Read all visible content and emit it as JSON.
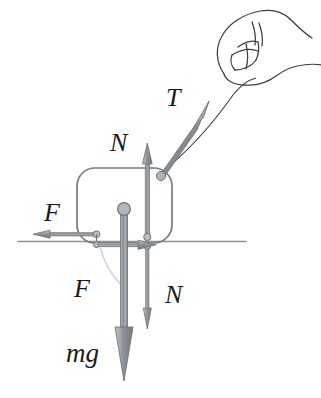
{
  "figure": {
    "type": "physics-free-body-diagram",
    "background_color": "#ffffff",
    "ink_color": "#5f6368",
    "label_color": "#1a1a1a",
    "arrow_fill": "#9aa0a6",
    "arrow_stroke": "#6b7075",
    "ground_color": "#8c9196"
  },
  "labels": {
    "tension": "T",
    "normal_up": "N",
    "normal_down": "N",
    "friction_on_block": "F",
    "friction_on_ground": "F",
    "weight": "mg"
  },
  "vectors": [
    {
      "name": "tension",
      "label": "T",
      "direction": "up-right",
      "applied_at": "block top-right corner",
      "label_x": 166,
      "label_y": 106,
      "font_size": 26
    },
    {
      "name": "normal-on-block",
      "label": "N",
      "direction": "up",
      "applied_at": "block bottom-right contact",
      "label_x": 113,
      "label_y": 151,
      "font_size": 26
    },
    {
      "name": "friction-on-block",
      "label": "F",
      "direction": "left",
      "applied_at": "block bottom-left contact",
      "label_x": 44,
      "label_y": 219,
      "font_size": 26
    },
    {
      "name": "friction-on-ground",
      "label": "F",
      "direction": "right",
      "applied_at": "ground contact",
      "label_x": 76,
      "label_y": 297,
      "font_size": 26
    },
    {
      "name": "normal-on-ground",
      "label": "N",
      "direction": "down",
      "applied_at": "ground contact",
      "label_x": 167,
      "label_y": 303,
      "font_size": 26
    },
    {
      "name": "weight",
      "label": "mg",
      "direction": "down",
      "applied_at": "center of mass",
      "label_x": 66,
      "label_y": 362,
      "font_size": 26
    }
  ],
  "objects": {
    "block": {
      "name": "block",
      "shape": "rounded-rectangle",
      "x": 77,
      "y": 168,
      "width": 95,
      "height": 75,
      "corner_radius": 18
    },
    "ground": {
      "name": "ground-line",
      "x1": 18,
      "y1": 241,
      "x2": 246,
      "y2": 241
    },
    "center_of_mass": {
      "name": "center-of-mass-dot",
      "cx": 124,
      "cy": 209,
      "r": 6
    },
    "hand": {
      "name": "hand",
      "description": "line-art hand gripping the string"
    },
    "string": {
      "name": "string",
      "description": "thin cord from block corner to hand"
    }
  }
}
